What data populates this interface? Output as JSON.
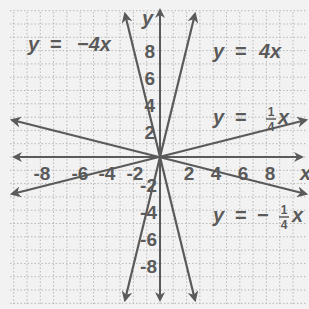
{
  "graph": {
    "origin_px": [
      160,
      157
    ],
    "unit_px": 13.3,
    "grid_color": "#b8b8b8",
    "line_color": "#5a5a5a",
    "background": "#f2f2f2",
    "axes": {
      "x_label": "x",
      "y_label": "y",
      "x_ticks": [
        "-8",
        "-6",
        "-4",
        "-2",
        "2",
        "4",
        "6",
        "8"
      ],
      "y_ticks": [
        "8",
        "6",
        "4",
        "2",
        "-2",
        "-4",
        "-6",
        "-8"
      ]
    },
    "equations": {
      "neg4": {
        "lhs": "y",
        "eq": "=",
        "rhs": "−4x"
      },
      "pos4": {
        "lhs": "y",
        "eq": "=",
        "rhs": "4x"
      },
      "quarter": {
        "lhs": "y",
        "eq": "=",
        "num": "1",
        "den": "4",
        "var": "x"
      },
      "negquarter": {
        "lhs": "y",
        "eq": "=",
        "sign": "−",
        "num": "1",
        "den": "4",
        "var": "x"
      }
    }
  },
  "chart_data": {
    "type": "line",
    "title": "",
    "xlabel": "x",
    "ylabel": "y",
    "xlim": [
      -11,
      11
    ],
    "ylim": [
      -11,
      11
    ],
    "grid": true,
    "x_ticks": [
      -8,
      -6,
      -4,
      -2,
      2,
      4,
      6,
      8
    ],
    "y_ticks": [
      -8,
      -6,
      -4,
      -2,
      2,
      4,
      6,
      8
    ],
    "series": [
      {
        "name": "y = -4x",
        "slope": -4,
        "x": [
          -2.6,
          2.6
        ],
        "y": [
          10.4,
          -10.4
        ]
      },
      {
        "name": "y = 4x",
        "slope": 4,
        "x": [
          -2.6,
          2.6
        ],
        "y": [
          -10.4,
          10.4
        ]
      },
      {
        "name": "y = 1/4 x",
        "slope": 0.25,
        "x": [
          -11.5,
          11
        ],
        "y": [
          -2.9,
          2.75
        ]
      },
      {
        "name": "y = -1/4 x",
        "slope": -0.25,
        "x": [
          -11.5,
          11
        ],
        "y": [
          2.9,
          -2.75
        ]
      }
    ]
  }
}
